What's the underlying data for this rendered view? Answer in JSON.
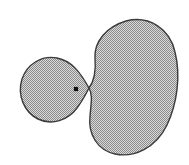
{
  "figure": {
    "background_color": "#ffffff",
    "width": 189,
    "height": 165,
    "fill_color": "#b3b3b3",
    "fill_pattern": "stipple-checker-50",
    "stipple_dark": "#8c8c8c",
    "stipple_light": "#d9d9d9",
    "outline_color": "#3b3b3b",
    "outline_width": 1.4,
    "marker_color": "#111111"
  },
  "shapes": {
    "small_blob": {
      "name": "small-teardrop-region",
      "label": "",
      "bbox": {
        "x": 20,
        "y": 57,
        "width": 70,
        "height": 66
      },
      "cusp_point": {
        "x": 89,
        "y": 88
      },
      "path": "M 89 88 C 80 72 72 61 57 58 C 42 55 27 64 22 79 C 17 95 24 112 38 119 C 52 126 68 120 77 108 C 83 100 86 94 89 88 Z"
    },
    "large_blob": {
      "name": "large-kidney-region",
      "label": "",
      "bbox": {
        "x": 88,
        "y": 20,
        "width": 88,
        "height": 136
      },
      "cusp_point": {
        "x": 89,
        "y": 88
      },
      "path": "M 89 88 C 95 80 96 70 95 58 C 94 42 106 27 126 21 C 149 15 170 29 175 52 C 181 76 177 104 167 125 C 156 148 134 158 115 154 C 97 150 88 134 90 116 C 91 103 93 95 89 88 Z"
    },
    "marker_dot": {
      "name": "interior-point-marker",
      "label": "",
      "center": {
        "x": 76,
        "y": 89
      },
      "size": 4.2
    }
  }
}
